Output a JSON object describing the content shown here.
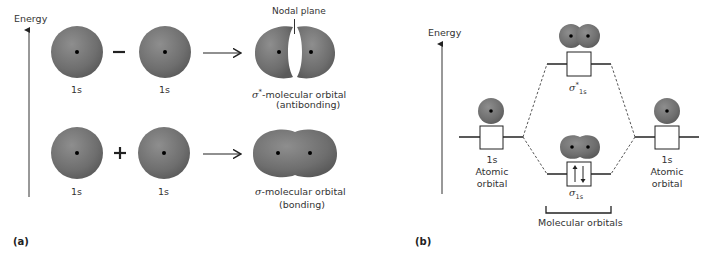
{
  "panel_a": {
    "label": "(a)",
    "axis_label": "Energy",
    "rows": [
      {
        "left_orbital": "1s",
        "operator": "−",
        "right_orbital": "1s",
        "result_symbol": "σ",
        "result_star": "*",
        "result_line1": "-molecular orbital",
        "result_line2": "(antibonding)",
        "annotation": "Nodal plane"
      },
      {
        "left_orbital": "1s",
        "operator": "+",
        "right_orbital": "1s",
        "result_symbol": "σ",
        "result_line1": "-molecular orbital",
        "result_line2": "(bonding)"
      }
    ]
  },
  "panel_b": {
    "label": "(b)",
    "axis_label": "Energy",
    "left_ao": {
      "name": "1s",
      "line2": "Atomic",
      "line3": "orbital"
    },
    "right_ao": {
      "name": "1s",
      "line2": "Atomic",
      "line3": "orbital"
    },
    "antibonding_mo": {
      "symbol": "σ",
      "star": "*",
      "subscript": "1s",
      "electrons": ""
    },
    "bonding_mo": {
      "symbol": "σ",
      "subscript": "1s",
      "electrons": "↑↓"
    },
    "bracket_label": "Molecular orbitals"
  },
  "colors": {
    "orbital_fill": "#7a7a7a",
    "line": "#333333",
    "background": "#ffffff"
  }
}
